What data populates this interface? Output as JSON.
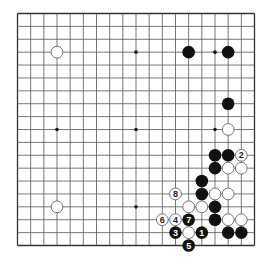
{
  "board": {
    "size": 19,
    "star_points": [
      [
        3,
        3
      ],
      [
        9,
        3
      ],
      [
        15,
        3
      ],
      [
        3,
        9
      ],
      [
        9,
        9
      ],
      [
        15,
        9
      ],
      [
        3,
        15
      ],
      [
        9,
        15
      ],
      [
        15,
        15
      ]
    ],
    "colors": {
      "line": "#555555",
      "edge": "#333333",
      "black": "#111111",
      "white": "#ffffff",
      "white_outline": "#666666",
      "black_label": "#ffffff",
      "white_label": "#222222"
    }
  },
  "stones": [
    {
      "color": "white",
      "col": 3,
      "row": 3
    },
    {
      "color": "black",
      "col": 13,
      "row": 3
    },
    {
      "color": "black",
      "col": 16,
      "row": 3
    },
    {
      "color": "black",
      "col": 16,
      "row": 7
    },
    {
      "color": "white",
      "col": 16,
      "row": 9
    },
    {
      "color": "black",
      "col": 15,
      "row": 11
    },
    {
      "color": "black",
      "col": 16,
      "row": 11
    },
    {
      "color": "black",
      "col": 15,
      "row": 12
    },
    {
      "color": "white",
      "col": 16,
      "row": 12
    },
    {
      "color": "white",
      "col": 17,
      "row": 12
    },
    {
      "color": "black",
      "col": 14,
      "row": 13
    },
    {
      "color": "black",
      "col": 14,
      "row": 14
    },
    {
      "color": "white",
      "col": 15,
      "row": 14
    },
    {
      "color": "white",
      "col": 16,
      "row": 14
    },
    {
      "color": "white",
      "col": 3,
      "row": 15
    },
    {
      "color": "white",
      "col": 13,
      "row": 15
    },
    {
      "color": "white",
      "col": 14,
      "row": 15
    },
    {
      "color": "black",
      "col": 15,
      "row": 15
    },
    {
      "color": "black",
      "col": 15,
      "row": 16
    },
    {
      "color": "white",
      "col": 16,
      "row": 16
    },
    {
      "color": "white",
      "col": 17,
      "row": 16
    },
    {
      "color": "white",
      "col": 13,
      "row": 17
    },
    {
      "color": "black",
      "col": 16,
      "row": 17
    },
    {
      "color": "black",
      "col": 17,
      "row": 17
    }
  ],
  "numbered_moves": [
    {
      "number": "1",
      "color": "black",
      "col": 14,
      "row": 17
    },
    {
      "number": "2",
      "color": "white",
      "col": 17,
      "row": 11
    },
    {
      "number": "3",
      "color": "black",
      "col": 12,
      "row": 17
    },
    {
      "number": "4",
      "color": "white",
      "col": 12,
      "row": 16
    },
    {
      "number": "5",
      "color": "black",
      "col": 13,
      "row": 18
    },
    {
      "number": "6",
      "color": "white",
      "col": 11,
      "row": 16
    },
    {
      "number": "7",
      "color": "black",
      "col": 13,
      "row": 16
    },
    {
      "number": "8",
      "color": "white",
      "col": 12,
      "row": 14
    }
  ]
}
